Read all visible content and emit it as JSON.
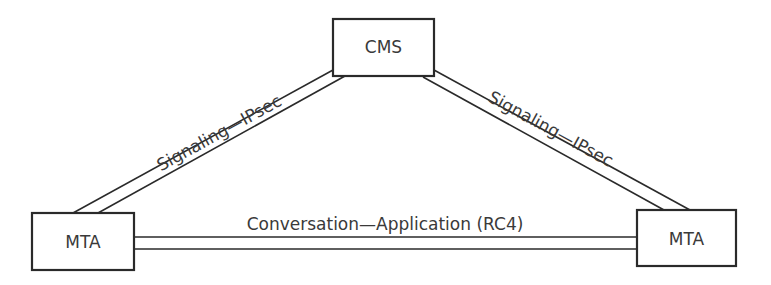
{
  "diagram": {
    "nodes": [
      {
        "id": "cms",
        "label": "CMS"
      },
      {
        "id": "mta_left",
        "label": "MTA"
      },
      {
        "id": "mta_right",
        "label": "MTA"
      }
    ],
    "edges": [
      {
        "from": "cms",
        "to": "mta_left",
        "label": "Signaling—IPsec",
        "style": "double-line"
      },
      {
        "from": "cms",
        "to": "mta_right",
        "label": "Signaling—IPsec",
        "style": "double-line"
      },
      {
        "from": "mta_left",
        "to": "mta_right",
        "label": "Conversation—Application (RC4)",
        "style": "double-line"
      }
    ],
    "colors": {
      "stroke": "#2a2a2a",
      "text": "#3a3a3a",
      "background": "#ffffff"
    }
  }
}
